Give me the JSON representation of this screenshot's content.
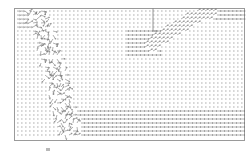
{
  "chart_data": {
    "type": "quiver",
    "title": "",
    "xlabel": "",
    "ylabel": "",
    "grid": false,
    "legend": null,
    "frame": {
      "x": 14,
      "y": 8,
      "width": 230,
      "height": 132,
      "color": "#9a9a9a"
    },
    "arrow_color": "#7a7a7a",
    "grid_spacing": {
      "dx": 4,
      "dy": 4
    },
    "features": [
      {
        "name": "dense-band-left",
        "description": "dense, disordered vectors in a diagonal band from upper-left (x≈20-60) down to lower-middle (x≈60-80, y≈140)",
        "path": [
          [
            35,
            10
          ],
          [
            45,
            40
          ],
          [
            55,
            75
          ],
          [
            62,
            105
          ],
          [
            70,
            135
          ]
        ],
        "width": 22
      },
      {
        "name": "top-left-streams",
        "description": "horizontal streamlines along the top-left edge",
        "region": [
          16,
          10,
          40,
          30
        ]
      },
      {
        "name": "vertical-wall",
        "description": "vertical line from top of frame down to y≈31 at x≈153, then bending right",
        "points": [
          [
            153,
            8
          ],
          [
            153,
            31
          ],
          [
            158,
            31
          ]
        ]
      },
      {
        "name": "diagonal-band-right",
        "description": "dense diagonal band of vectors rising from (150,40) to (205,12)",
        "path": [
          [
            150,
            45
          ],
          [
            170,
            32
          ],
          [
            190,
            20
          ],
          [
            208,
            12
          ]
        ],
        "width": 14
      },
      {
        "name": "top-right-streams",
        "description": "strong horizontal streamlines at top-right (y≈12-18, x≈195-244)",
        "region": [
          195,
          10,
          244,
          20
        ]
      },
      {
        "name": "middle-right-streams",
        "description": "horizontal streamlines leftwards from diagonal band (y≈30-55, x≈130-170)",
        "region": [
          125,
          30,
          170,
          55
        ]
      },
      {
        "name": "bottom-streams",
        "description": "horizontal streamlines along lower region right of the left band (y≈110-138, x≈75-244)",
        "region": [
          75,
          110,
          244,
          138
        ]
      }
    ]
  }
}
